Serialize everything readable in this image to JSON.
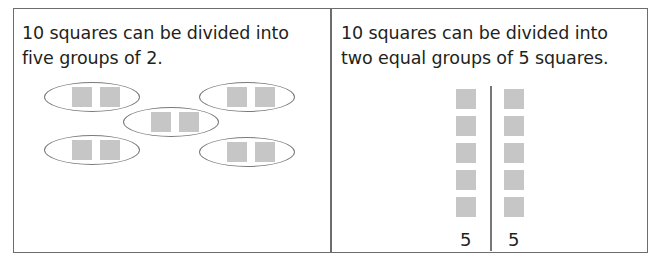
{
  "panels": [
    {
      "caption_line1": "10 squares can be divided into",
      "caption_line2": "five groups of 2.",
      "groups": 5,
      "squares_per_group": 2
    },
    {
      "caption_line1": "10 squares can be divided into",
      "caption_line2": "two equal groups of 5 squares.",
      "groups": 2,
      "squares_per_group": 5,
      "labels": [
        "5",
        "5"
      ]
    }
  ],
  "colors": {
    "square": "#c6c6c6",
    "outline": "#7a7a7a",
    "border": "#6d6d6d"
  }
}
